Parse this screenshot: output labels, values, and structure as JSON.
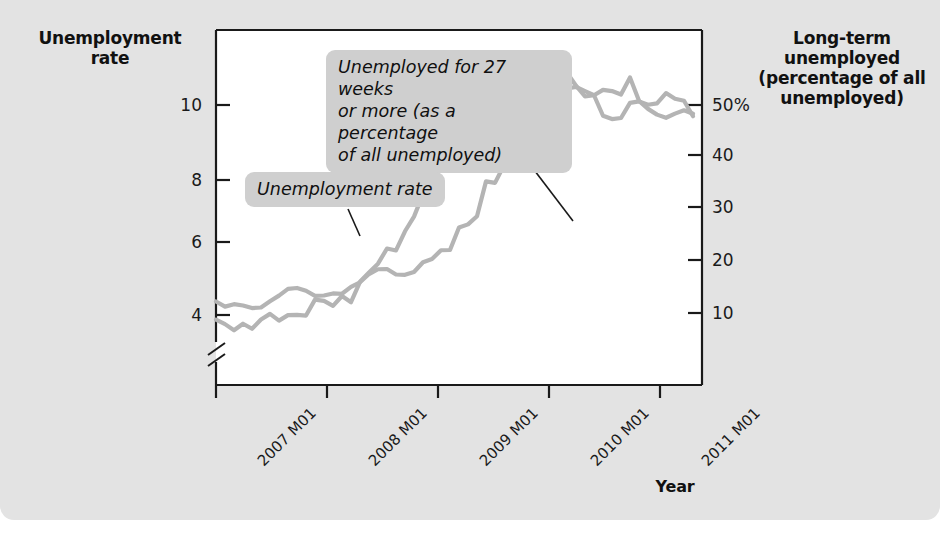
{
  "figure": {
    "background_color": "#e3e3e3",
    "plot_background_color": "#ffffff",
    "line_color": "#b4b4b4",
    "axis_color": "#1a1a1a"
  },
  "labels": {
    "left_axis_title": "Unemployment\nrate",
    "right_axis_title": "Long-term\nunemployed\n(percentage\nof all\nunemployed)",
    "x_axis_title": "Year"
  },
  "callouts": {
    "long_term": "Unemployed for 27 weeks\nor more (as a percentage\nof all unemployed)",
    "unemployment_rate": "Unemployment rate"
  },
  "chart_data": {
    "type": "line",
    "title": "",
    "xlabel": "Year",
    "grid": false,
    "legend": "annotations",
    "axis_break_left": true,
    "x_tick_labels": [
      "2007 M01",
      "2008 M01",
      "2009 M01",
      "2010 M01",
      "2011 M01"
    ],
    "x_tick_values": [
      0,
      12,
      24,
      36,
      48
    ],
    "xlim": [
      0,
      54
    ],
    "left_axis": {
      "label": "Unemployment rate",
      "tick_labels": [
        "10",
        "8",
        "6",
        "4"
      ],
      "tick_values": [
        10,
        8,
        6,
        4
      ],
      "ylim": [
        3.2,
        10.8
      ]
    },
    "right_axis": {
      "label": "Long-term unemployed (percentage of all unemployed)",
      "tick_labels": [
        "50%",
        "40",
        "30",
        "20",
        "10"
      ],
      "tick_values": [
        50,
        40,
        30,
        20,
        10
      ],
      "ylim": [
        6.4,
        53.6
      ]
    },
    "series": [
      {
        "name": "Unemployment rate",
        "axis": "left",
        "unit": "percent",
        "values": [
          4.6,
          4.5,
          4.4,
          4.5,
          4.4,
          4.6,
          4.7,
          4.6,
          4.7,
          4.7,
          4.7,
          5.0,
          5.0,
          4.9,
          5.1,
          5.0,
          5.4,
          5.6,
          5.8,
          6.1,
          6.1,
          6.5,
          6.8,
          7.3,
          7.8,
          8.3,
          8.7,
          9.0,
          9.4,
          9.5,
          9.5,
          9.6,
          9.8,
          10.0,
          9.9,
          9.9,
          9.8,
          9.8,
          9.9,
          9.9,
          9.6,
          9.4,
          9.4,
          9.5,
          9.5,
          9.4,
          9.8,
          9.3,
          9.1,
          9.0,
          8.9,
          9.0,
          9.1,
          9.0
        ]
      },
      {
        "name": "Unemployed for 27 weeks or more (as a percentage of all unemployed)",
        "axis": "right",
        "unit": "percent_of_unemployed",
        "values": [
          17.5,
          16.8,
          17.3,
          16.9,
          16.6,
          16.7,
          17.4,
          18.4,
          19.2,
          19.3,
          19.0,
          18.1,
          18.3,
          18.6,
          18.5,
          19.6,
          20.0,
          21.1,
          21.8,
          21.7,
          21.2,
          21.1,
          21.4,
          22.8,
          23.0,
          24.3,
          24.4,
          27.3,
          27.9,
          28.8,
          33.4,
          33.3,
          35.5,
          35.6,
          38.0,
          39.5,
          41.5,
          41.1,
          44.4,
          45.9,
          46.0,
          45.6,
          44.9,
          42.1,
          41.8,
          41.8,
          44.0,
          44.2,
          43.6,
          43.9,
          45.1,
          44.4,
          44.3,
          42.1
        ]
      }
    ]
  }
}
